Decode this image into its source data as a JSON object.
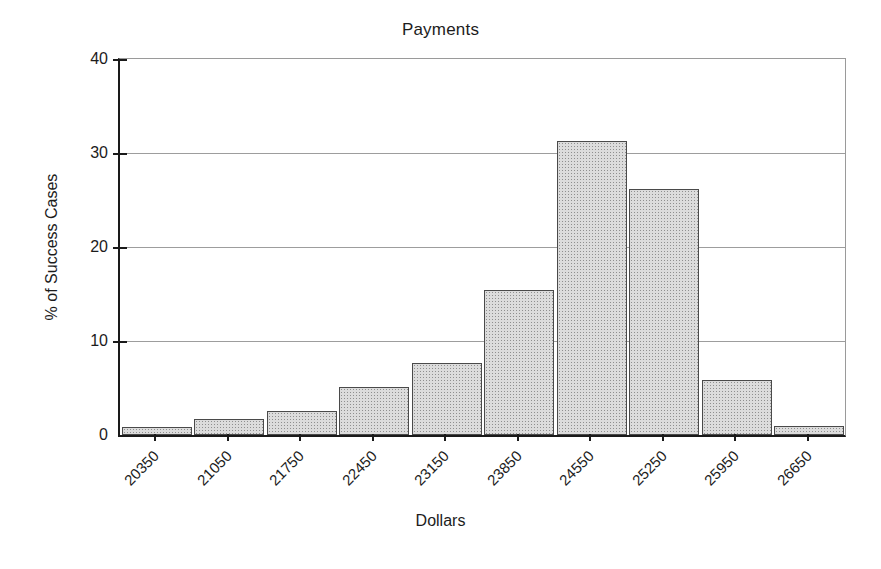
{
  "chart_data": {
    "type": "bar",
    "title": "Payments",
    "xlabel": "Dollars",
    "ylabel": "% of Success Cases",
    "categories": [
      "20350",
      "21050",
      "21750",
      "22450",
      "23150",
      "23850",
      "24550",
      "25250",
      "25950",
      "26650"
    ],
    "values": [
      0.8,
      1.7,
      2.6,
      5.1,
      7.7,
      15.4,
      31.3,
      26.2,
      5.9,
      1.0
    ],
    "ylim": [
      0,
      40
    ],
    "yticks": [
      0,
      10,
      20,
      30,
      40
    ],
    "ytick_labels": [
      "0",
      "10",
      "20",
      "30",
      "40"
    ],
    "grid": true,
    "legend": "none",
    "bar_fill": "#dcdcdc",
    "bar_edge": "#4a4a4a",
    "axis_color": "#1a1a1a",
    "gridline_color": "#9d9d9d"
  }
}
